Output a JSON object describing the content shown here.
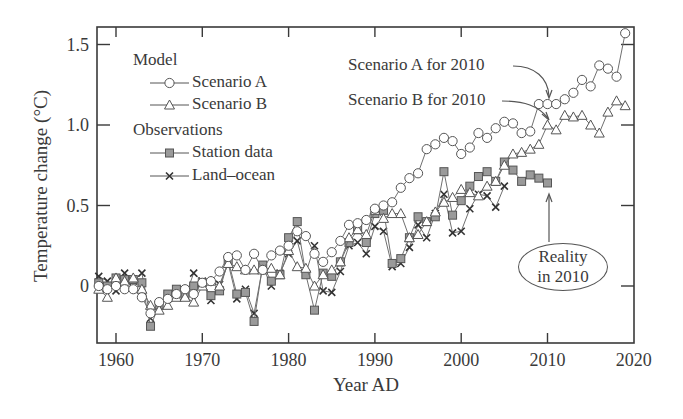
{
  "chart_data": {
    "type": "line",
    "title": "",
    "xlabel": "Year AD",
    "ylabel": "Temperature change (°C)",
    "xlim": [
      1958,
      2020
    ],
    "ylim": [
      -0.35,
      1.6
    ],
    "x_ticks": [
      1960,
      1970,
      1980,
      1990,
      2000,
      2010,
      2020
    ],
    "x_tick_labels": [
      "1960",
      "1970",
      "1980",
      "1990",
      "2000",
      "2010",
      "2020"
    ],
    "y_ticks": [
      0,
      0.5,
      1.0,
      1.5
    ],
    "y_tick_labels": [
      "0",
      "0.5",
      "1.0",
      "1.5"
    ],
    "grid": false,
    "legend_position": "upper left",
    "legend_groups": [
      {
        "heading": "Model",
        "entries": [
          "Scenario A",
          "Scenario B"
        ]
      },
      {
        "heading": "Observations",
        "entries": [
          "Station data",
          "Land-ocean"
        ]
      }
    ],
    "series": [
      {
        "name": "Scenario A",
        "group": "Model",
        "marker": "circle-open",
        "x": [
          1958,
          1959,
          1960,
          1961,
          1962,
          1963,
          1964,
          1965,
          1966,
          1967,
          1968,
          1969,
          1970,
          1971,
          1972,
          1973,
          1974,
          1975,
          1976,
          1977,
          1978,
          1979,
          1980,
          1981,
          1982,
          1983,
          1984,
          1985,
          1986,
          1987,
          1988,
          1989,
          1990,
          1991,
          1992,
          1993,
          1994,
          1995,
          1996,
          1997,
          1998,
          1999,
          2000,
          2001,
          2002,
          2003,
          2004,
          2005,
          2006,
          2007,
          2008,
          2009,
          2010,
          2011,
          2012,
          2013,
          2014,
          2015,
          2016,
          2017,
          2018,
          2019
        ],
        "values": [
          0.0,
          -0.02,
          0.0,
          -0.02,
          -0.02,
          -0.07,
          -0.17,
          -0.1,
          -0.08,
          -0.05,
          -0.02,
          -0.05,
          0.02,
          0.03,
          0.09,
          0.18,
          0.19,
          0.1,
          0.2,
          0.1,
          0.19,
          0.22,
          0.25,
          0.34,
          0.31,
          0.2,
          0.15,
          0.21,
          0.28,
          0.38,
          0.39,
          0.41,
          0.48,
          0.5,
          0.52,
          0.61,
          0.67,
          0.7,
          0.85,
          0.88,
          0.92,
          0.9,
          0.82,
          0.86,
          0.95,
          0.92,
          0.98,
          1.02,
          1.01,
          0.95,
          0.96,
          1.13,
          1.13,
          1.13,
          1.16,
          1.2,
          1.28,
          1.24,
          1.37,
          1.35,
          1.3,
          1.57
        ]
      },
      {
        "name": "Scenario B",
        "group": "Model",
        "marker": "triangle-open",
        "x": [
          1958,
          1959,
          1960,
          1961,
          1962,
          1963,
          1964,
          1965,
          1966,
          1967,
          1968,
          1969,
          1970,
          1971,
          1972,
          1973,
          1974,
          1975,
          1976,
          1977,
          1978,
          1979,
          1980,
          1981,
          1982,
          1983,
          1984,
          1985,
          1986,
          1987,
          1988,
          1989,
          1990,
          1991,
          1992,
          1993,
          1994,
          1995,
          1996,
          1997,
          1998,
          1999,
          2000,
          2001,
          2002,
          2003,
          2004,
          2005,
          2006,
          2007,
          2008,
          2009,
          2010,
          2011,
          2012,
          2013,
          2014,
          2015,
          2016,
          2017,
          2018,
          2019
        ],
        "values": [
          -0.02,
          -0.07,
          0.05,
          0.03,
          0.05,
          -0.02,
          -0.12,
          -0.15,
          -0.12,
          -0.07,
          -0.07,
          -0.1,
          0.0,
          0.03,
          0.0,
          0.14,
          0.12,
          0.1,
          0.1,
          0.1,
          0.11,
          0.07,
          0.22,
          0.12,
          0.11,
          0.0,
          0.07,
          0.1,
          0.15,
          0.3,
          0.35,
          0.32,
          0.47,
          0.42,
          0.45,
          0.45,
          0.3,
          0.32,
          0.4,
          0.46,
          0.52,
          0.55,
          0.6,
          0.58,
          0.56,
          0.62,
          0.65,
          0.75,
          0.82,
          0.83,
          0.85,
          0.88,
          1.0,
          0.97,
          1.06,
          1.05,
          1.06,
          1.0,
          0.95,
          1.08,
          1.15,
          1.12
        ]
      },
      {
        "name": "Station data",
        "group": "Observations",
        "marker": "square-filled",
        "x": [
          1958,
          1959,
          1960,
          1961,
          1962,
          1963,
          1964,
          1965,
          1966,
          1967,
          1968,
          1969,
          1970,
          1971,
          1972,
          1973,
          1974,
          1975,
          1976,
          1977,
          1978,
          1979,
          1980,
          1981,
          1982,
          1983,
          1984,
          1985,
          1986,
          1987,
          1988,
          1989,
          1990,
          1991,
          1992,
          1993,
          1994,
          1995,
          1996,
          1997,
          1998,
          1999,
          2000,
          2001,
          2002,
          2003,
          2004,
          2005,
          2006,
          2007,
          2008,
          2009,
          2010
        ],
        "values": [
          0.02,
          0.0,
          0.05,
          0.04,
          0.04,
          0.02,
          -0.25,
          -0.12,
          -0.05,
          -0.02,
          -0.05,
          0.0,
          0.02,
          -0.06,
          -0.03,
          0.16,
          -0.05,
          -0.04,
          -0.22,
          0.13,
          0.03,
          0.07,
          0.3,
          0.4,
          0.07,
          -0.15,
          0.08,
          0.06,
          0.15,
          0.27,
          0.35,
          0.27,
          0.45,
          0.47,
          0.14,
          0.17,
          0.3,
          0.43,
          0.4,
          0.43,
          0.71,
          0.44,
          0.53,
          0.62,
          0.68,
          0.71,
          0.65,
          0.77,
          0.72,
          0.65,
          0.69,
          0.67,
          0.64
        ]
      },
      {
        "name": "Land-ocean",
        "group": "Observations",
        "marker": "x",
        "x": [
          1958,
          1959,
          1960,
          1961,
          1962,
          1963,
          1964,
          1965,
          1966,
          1967,
          1968,
          1969,
          1970,
          1971,
          1972,
          1973,
          1974,
          1975,
          1976,
          1977,
          1978,
          1979,
          1980,
          1981,
          1982,
          1983,
          1984,
          1985,
          1986,
          1987,
          1988,
          1989,
          1990,
          1991,
          1992,
          1993,
          1994,
          1995,
          1996,
          1997,
          1998,
          1999,
          2000,
          2001,
          2002,
          2003,
          2004,
          2005
        ],
        "values": [
          0.06,
          0.03,
          -0.03,
          0.08,
          0.03,
          0.08,
          -0.2,
          -0.11,
          -0.06,
          -0.02,
          -0.07,
          0.08,
          0.03,
          -0.09,
          0.01,
          0.14,
          -0.08,
          -0.02,
          -0.17,
          0.12,
          0.0,
          0.08,
          0.2,
          0.28,
          0.08,
          0.25,
          -0.03,
          -0.04,
          0.09,
          0.25,
          0.27,
          0.2,
          0.37,
          0.34,
          0.12,
          0.14,
          0.24,
          0.38,
          0.3,
          0.45,
          0.57,
          0.33,
          0.34,
          0.48,
          0.57,
          0.56,
          0.49,
          0.62
        ]
      }
    ],
    "annotations": [
      {
        "text": "Scenario A for 2010",
        "points_to": {
          "year": 2010,
          "series": "Scenario A"
        }
      },
      {
        "text": "Scenario B for 2010",
        "points_to": {
          "year": 2010,
          "series": "Scenario B"
        }
      },
      {
        "text_lines": [
          "Reality",
          "in 2010"
        ],
        "points_to": {
          "year": 2010,
          "series": "Station data"
        },
        "shape": "ellipse"
      }
    ]
  },
  "legend": {
    "model_heading": "Model",
    "scenario_a": "Scenario A",
    "scenario_b": "Scenario B",
    "observations_heading": "Observations",
    "station_data": "Station data",
    "land_ocean": "Land–ocean"
  },
  "annotations": {
    "scenario_a_2010": "Scenario A for 2010",
    "scenario_b_2010": "Scenario B for 2010",
    "reality_line1": "Reality",
    "reality_line2": "in 2010"
  },
  "axes": {
    "xlabel": "Year AD",
    "ylabel": "Temperature change (°C)"
  },
  "colors": {
    "axis": "#3a3a3a",
    "line": "#707070",
    "marker_fill_square": "#9a9a9a",
    "marker_open": "#ffffff"
  }
}
